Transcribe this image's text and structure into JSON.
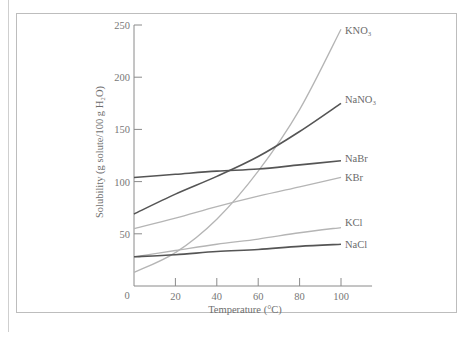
{
  "chart_data": {
    "type": "line",
    "title": "",
    "xlabel": "Temperature (°C)",
    "ylabel": "Solubility (g solute/100 g H₂O)",
    "xlim": [
      0,
      115
    ],
    "ylim": [
      0,
      250
    ],
    "x_ticks": [
      0,
      20,
      40,
      60,
      80,
      100
    ],
    "y_ticks": [
      0,
      50,
      100,
      150,
      200,
      250
    ],
    "grid": false,
    "legend_position": "inline-right",
    "x": [
      0,
      20,
      40,
      60,
      80,
      100
    ],
    "series": [
      {
        "name": "KNO₃",
        "tone": "light",
        "values": [
          13,
          32,
          64,
          110,
          169,
          246
        ]
      },
      {
        "name": "NaNO₃",
        "tone": "dark",
        "values": [
          69,
          88,
          105,
          124,
          148,
          175
        ]
      },
      {
        "name": "NaBr",
        "tone": "dark",
        "values": [
          104,
          107,
          110,
          112,
          116,
          120
        ]
      },
      {
        "name": "KBr",
        "tone": "light",
        "values": [
          55,
          65,
          76,
          86,
          95,
          104
        ]
      },
      {
        "name": "KCl",
        "tone": "light",
        "values": [
          28,
          34,
          40,
          45,
          51,
          56
        ]
      },
      {
        "name": "NaCl",
        "tone": "dark",
        "values": [
          28,
          30,
          33,
          35,
          38,
          40
        ]
      }
    ]
  },
  "colors": {
    "dark_line": "#555555",
    "light_line": "#b5b5b5",
    "axis": "#8a8a8a",
    "frame": "#bdbdbd"
  }
}
